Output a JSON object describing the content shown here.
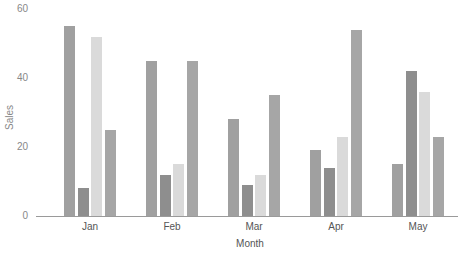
{
  "chart_data": {
    "type": "bar",
    "title": "",
    "xlabel": "Month",
    "ylabel": "Sales",
    "ylim": [
      0,
      60
    ],
    "yticks": [
      0,
      20,
      40,
      60
    ],
    "categories": [
      "Jan",
      "Feb",
      "Mar",
      "Apr",
      "May"
    ],
    "series": [
      {
        "name": "Series 1",
        "color": "#a0a0a0",
        "values": [
          55,
          45,
          28,
          19,
          15
        ]
      },
      {
        "name": "Series 2",
        "color": "#8e8e8e",
        "values": [
          8,
          12,
          9,
          14,
          42
        ]
      },
      {
        "name": "Series 3",
        "color": "#dadada",
        "values": [
          52,
          15,
          12,
          23,
          36
        ]
      },
      {
        "name": "Series 4",
        "color": "#a6a6a6",
        "values": [
          25,
          45,
          35,
          54,
          23
        ]
      }
    ],
    "grid": false,
    "legend": "none"
  },
  "labels": {
    "y0": "0",
    "y20": "20",
    "y40": "40",
    "y60": "60",
    "ylabel": "Sales",
    "xlabel": "Month",
    "jan": "Jan",
    "feb": "Feb",
    "mar": "Mar",
    "apr": "Apr",
    "may": "May"
  }
}
